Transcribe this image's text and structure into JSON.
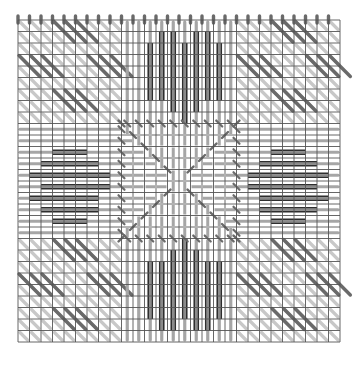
{
  "diagram": {
    "title": "",
    "type": "needlepoint-stitch-chart",
    "grid": {
      "origin_x": 18,
      "origin_y": 20,
      "cell": 11.5,
      "cols": 28,
      "rows": 28,
      "line_color": "#555555",
      "background": "#ffffff"
    },
    "colors": {
      "light_stitch": "#c8c8c8",
      "mid_stitch": "#a6a6a6",
      "dark_stitch": "#6a6a6a",
      "motif_outline": "#2e2e2e",
      "motif_fill": "#8a8a8a"
    },
    "regions": [
      {
        "name": "top-left-corner",
        "pattern": "diagonal-blocks"
      },
      {
        "name": "top-center",
        "pattern": "vertical-heart-motif"
      },
      {
        "name": "top-right-corner",
        "pattern": "diagonal-blocks"
      },
      {
        "name": "middle-left",
        "pattern": "horizontal-diamond-motif"
      },
      {
        "name": "center",
        "pattern": "radiating-star"
      },
      {
        "name": "middle-right",
        "pattern": "horizontal-diamond-motif"
      },
      {
        "name": "bottom-left-corner",
        "pattern": "diagonal-blocks"
      },
      {
        "name": "bottom-center",
        "pattern": "vertical-heart-motif"
      },
      {
        "name": "bottom-right-corner",
        "pattern": "diagonal-blocks"
      }
    ]
  }
}
